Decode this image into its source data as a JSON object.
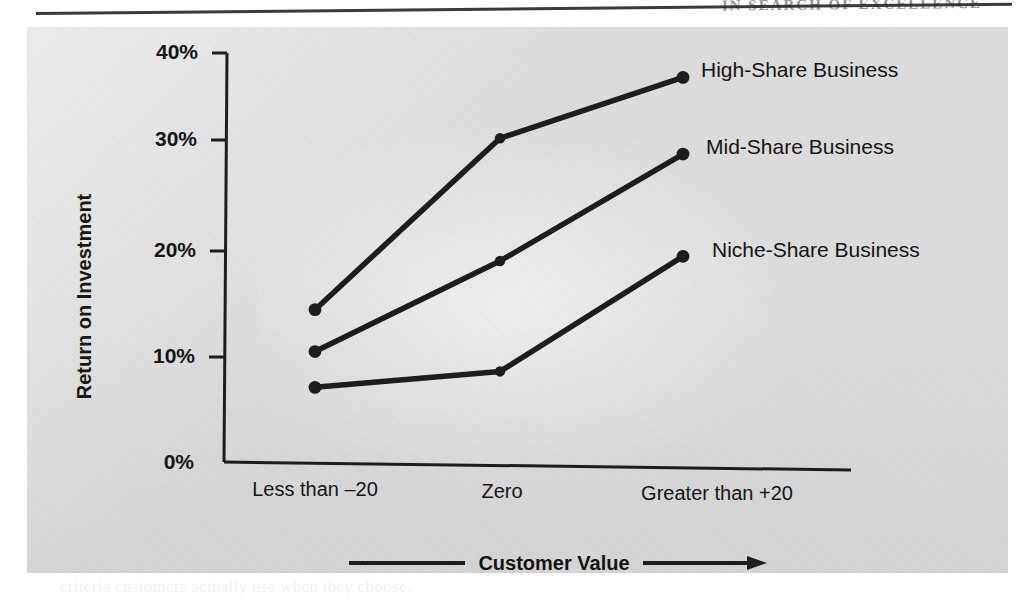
{
  "page": {
    "running_head": "IN SEARCH OF EXCELLENCE",
    "bleed_lines": [
      "value and the relative market share of the business",
      "delivered to customers. As shown in the exhibit,",
      "businesses that achieve superior customer value",
      "returns in every share position, but the advantage",
      "is greatest for the high-share competitors. Market",
      "leaders who also deliver superior value earn nearly",
      "four times the return of niche players that deliver",
      "inferior value to their chosen customers.",
      "The practical implication for strategy is direct:",
      "improving perceived quality relative to competitors",
      "raises profitability regardless of the share position",
      "a business currently occupies in its served market.",
      "Managers should therefore measure customer value",
      "continuously rather than relying on internal quality",
      "standards that may bear little relation to the",
      "criteria customers actually use when they choose.",
      "Superior Customer Value Drives Return on",
      "Investment"
    ]
  },
  "panel": {
    "background_color": "#dcdcdc",
    "line_color": "#1d1d1d"
  },
  "chart_data": {
    "type": "line",
    "title": "",
    "xlabel": "Customer Value",
    "ylabel": "Return on Investment",
    "categories": [
      "Less than –20",
      "Zero",
      "Greater than +20"
    ],
    "x_tick_labels": [
      "Less than –20",
      "Zero",
      "Greater than +20"
    ],
    "y_tick_labels": [
      "0%",
      "10%",
      "20%",
      "30%",
      "40%"
    ],
    "y_ticks": [
      0,
      10,
      20,
      30,
      40
    ],
    "ylim": [
      0,
      40
    ],
    "grid": false,
    "legend_position": "right-of-endpoints",
    "marker": "circle",
    "series": [
      {
        "name": "High-Share Business",
        "label": "High-Share Business",
        "values": [
          14.9,
          32.0,
          38.3
        ]
      },
      {
        "name": "Mid-Share Business",
        "label": "Mid-Share Business",
        "values": [
          10.8,
          20.0,
          30.8
        ]
      },
      {
        "name": "Niche-Share Business",
        "label": "Niche-Share Business",
        "values": [
          7.3,
          9.2,
          20.8
        ]
      }
    ],
    "axis_arrow_annotation": "Customer Value"
  }
}
